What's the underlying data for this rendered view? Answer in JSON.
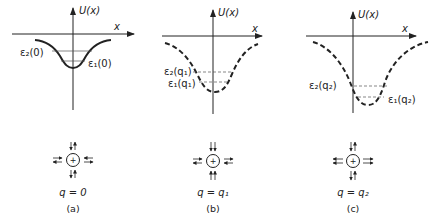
{
  "axes": {
    "y_label": "U(x)",
    "x_label": "x"
  },
  "panels": [
    {
      "id": "a",
      "caption": "(a)",
      "q_label": "q = 0",
      "curve_style": "solid",
      "level_upper": "ε₂(0)",
      "level_lower": "ε₁(0)",
      "horizontal_arrows": "inward-outward pairs",
      "vertical_arrows": "balanced pairs"
    },
    {
      "id": "b",
      "caption": "(b)",
      "q_label": "q = q₁",
      "curve_style": "dashed",
      "level_upper": "ε₂(q₁)",
      "level_lower": "ε₁(q₁)",
      "horizontal_arrows": "inward-outward pairs",
      "vertical_arrows": "both pointing toward charge"
    },
    {
      "id": "c",
      "caption": "(c)",
      "q_label": "q = q₂",
      "curve_style": "dashed",
      "level_upper": "ε₂(q₂)",
      "level_lower": "ε₁(q₂)",
      "horizontal_arrows": "outward pairs",
      "vertical_arrows": "balanced pairs"
    }
  ],
  "colors": {
    "ink": "#222222",
    "background": "#ffffff"
  }
}
